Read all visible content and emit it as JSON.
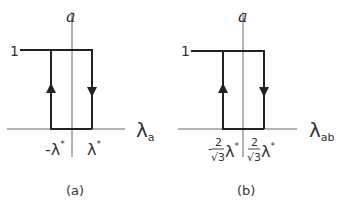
{
  "panels": [
    {
      "id": "a",
      "caption": "(a)",
      "y_axis_label": "a",
      "x_axis_label": "λ",
      "x_axis_sub": "a",
      "y_tick": "1",
      "neg_tick": "-λ",
      "pos_tick": "λ",
      "star": "*"
    },
    {
      "id": "b",
      "caption": "(b)",
      "y_axis_label": "a",
      "x_axis_label": "λ",
      "x_axis_sub": "ab",
      "y_tick": "1",
      "neg_sign": "-",
      "frac_num": "2",
      "frac_den": "√3",
      "lambda": "λ",
      "star": "*"
    }
  ],
  "colors": {
    "line": "#222222",
    "axis": "#555555"
  }
}
